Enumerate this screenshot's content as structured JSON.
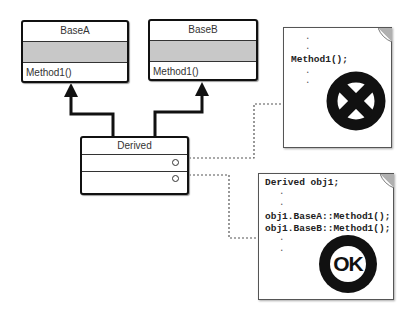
{
  "diagram": {
    "classes": {
      "base_a": {
        "name": "BaseA",
        "operation": "Method1()"
      },
      "base_b": {
        "name": "BaseB",
        "operation": "Method1()"
      },
      "derived": {
        "name": "Derived"
      }
    },
    "note_ambiguous": {
      "lines": [
        ".",
        ".",
        "Method1();",
        ".",
        "."
      ],
      "status_icon": "error-x-icon"
    },
    "note_resolved": {
      "lines": [
        "Derived obj1;",
        ".",
        ".",
        "obj1.BaseA::Method1();",
        "obj1.BaseB::Method1();",
        ".",
        "."
      ],
      "status_label": "OK"
    },
    "colors": {
      "stroke": "#111111",
      "attr_fill": "#c8c8c8",
      "corner_fold": "#b0b0b0"
    }
  }
}
